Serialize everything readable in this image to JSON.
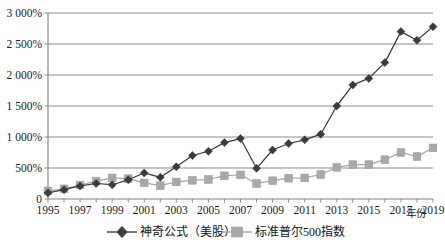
{
  "chart_data": {
    "type": "line",
    "title": "",
    "xlabel": "年份",
    "ylabel": "",
    "grid": true,
    "legend_position": "bottom",
    "x": [
      1995,
      1996,
      1997,
      1998,
      1999,
      2000,
      2001,
      2002,
      2003,
      2004,
      2005,
      2006,
      2007,
      2008,
      2009,
      2010,
      2011,
      2012,
      2013,
      2014,
      2015,
      2016,
      2017,
      2018,
      2019
    ],
    "xtick_labels": [
      "1995",
      "1997",
      "1999",
      "2001",
      "2003",
      "2005",
      "2007",
      "2009",
      "2011",
      "2013",
      "2015",
      "2017",
      "2019"
    ],
    "xtick_values": [
      1995,
      1997,
      1999,
      2001,
      2003,
      2005,
      2007,
      2009,
      2011,
      2013,
      2015,
      2017,
      2019
    ],
    "ytick_labels": [
      "0",
      "500%",
      "1 000%",
      "1 500%",
      "2 000%",
      "2 500%",
      "3 000%"
    ],
    "ytick_values": [
      0,
      500,
      1000,
      1500,
      2000,
      2500,
      3000
    ],
    "ylim": [
      0,
      3000
    ],
    "xlim": [
      1995,
      2019
    ],
    "series": [
      {
        "name": "神奇公式（美股）",
        "marker": "diamond",
        "color": "#3b3b3b",
        "values": [
          100,
          150,
          210,
          250,
          230,
          310,
          420,
          350,
          520,
          700,
          770,
          910,
          975,
          495,
          790,
          895,
          955,
          1045,
          1500,
          1840,
          1945,
          2200,
          2700,
          2560,
          2780
        ]
      },
      {
        "name": "标准普尔500指数",
        "marker": "square",
        "color": "#a8a8a8",
        "values": [
          130,
          165,
          225,
          290,
          340,
          330,
          260,
          215,
          275,
          300,
          315,
          375,
          390,
          250,
          295,
          335,
          340,
          395,
          510,
          555,
          555,
          635,
          750,
          685,
          825
        ]
      }
    ]
  },
  "axis": {
    "x_axis_title": "年份"
  },
  "legend": {
    "items": [
      {
        "label": "神奇公式（美股）",
        "marker": "diamond-marker"
      },
      {
        "label": "标准普尔500指数",
        "marker": "square-marker"
      }
    ]
  }
}
